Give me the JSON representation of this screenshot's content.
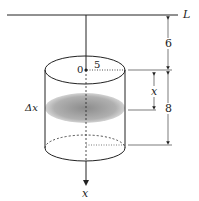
{
  "labels": {
    "line": "L",
    "origin": "0",
    "radius": "5",
    "top_gap": "6",
    "depth_var": "x",
    "height": "8",
    "slice": "Δx",
    "axis": "x"
  },
  "colors": {
    "stroke": "#222222",
    "slice_fill": "#9a9a9a"
  }
}
